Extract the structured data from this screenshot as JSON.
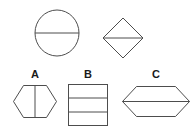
{
  "canvas": {
    "width": 196,
    "height": 134,
    "background": "#ffffff",
    "stroke_color": "#4d4d4d",
    "stroke_width": 1
  },
  "prompt_row": {
    "name": "question-shapes",
    "shapes": [
      {
        "id": "circle",
        "type": "circle",
        "divider": "horizontal-diameter",
        "cx": 57,
        "cy": 33,
        "rx": 22,
        "ry": 23
      },
      {
        "id": "diamond",
        "type": "diamond",
        "divider": "horizontal-diagonal",
        "cx": 123,
        "cy": 38,
        "half_w": 20,
        "half_h": 20
      }
    ]
  },
  "answer_row": {
    "name": "answer-options",
    "options": [
      {
        "id": "A",
        "label": "A",
        "type": "hexagon",
        "divider": "vertical",
        "x": 13,
        "y": 85,
        "width": 44,
        "height": 33,
        "inset": 10,
        "label_x": 25,
        "label_y": 69
      },
      {
        "id": "B",
        "label": "B",
        "type": "rectangle",
        "divider": "two-horizontal",
        "x": 68,
        "y": 84,
        "width": 40,
        "height": 42,
        "label_x": 78,
        "label_y": 69
      },
      {
        "id": "C",
        "label": "C",
        "type": "hexagon",
        "divider": "horizontal",
        "x": 122,
        "y": 86,
        "width": 68,
        "height": 31,
        "inset": 14,
        "label_x": 146,
        "label_y": 69
      }
    ]
  }
}
